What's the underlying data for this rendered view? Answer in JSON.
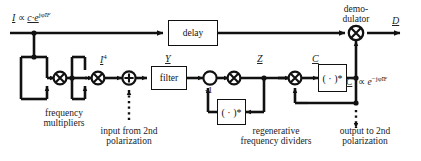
{
  "diagram": {
    "signals": {
      "input": {
        "name": "I",
        "relation": "∝",
        "expr": "c·e",
        "exponent": "jφ̃",
        "exponent_sub": "IF",
        "full": "I ∝ c·e^{jφ̃_IF}"
      },
      "i_fourth": {
        "name": "I",
        "power": "4"
      },
      "y": {
        "name": "Y"
      },
      "z": {
        "name": "Z"
      },
      "c": {
        "name": "C"
      },
      "d": {
        "name": "D"
      },
      "c_conj": {
        "name": "C",
        "star": "*",
        "relation": "∝",
        "expr": "e",
        "exponent": "−jφ̃",
        "exponent_sub": "IF",
        "full": "C* ∝ e^{−jφ̃_IF}"
      }
    },
    "blocks": {
      "delay": "delay",
      "filter": "filter",
      "conj_lower": "( · )*",
      "conj_upper": "( · )*",
      "gain": "-1"
    },
    "operators": {
      "mult1": "⊗",
      "mult2": "⊗",
      "mult3": "⊗",
      "mult4": "⊗",
      "demod": "⊗",
      "adder": "⊕"
    },
    "captions": {
      "frequency_multipliers": [
        "frequency",
        "multipliers"
      ],
      "demodulator": [
        "demo-",
        "dulator"
      ],
      "input_second_pol": [
        "input from 2nd",
        "polarization"
      ],
      "regenerative_dividers": [
        "regenerative",
        "frequency dividers"
      ],
      "output_second_pol": [
        "output to 2nd",
        "polarization"
      ]
    },
    "colors": {
      "line": "#111111",
      "background": "#ffffff",
      "text": "#222222"
    }
  }
}
